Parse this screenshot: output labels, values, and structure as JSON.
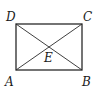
{
  "diagram": {
    "type": "geometry",
    "shape": "rectangle",
    "stroke_color": "#2a2a2a",
    "points": {
      "A": {
        "label": "A",
        "x": 16,
        "y": 70
      },
      "B": {
        "label": "B",
        "x": 82,
        "y": 70
      },
      "C": {
        "label": "C",
        "x": 82,
        "y": 24
      },
      "D": {
        "label": "D",
        "x": 16,
        "y": 24
      },
      "E": {
        "label": "E",
        "x": 49,
        "y": 47
      }
    },
    "segments": [
      "AB",
      "BC",
      "CD",
      "DA",
      "AC",
      "BD"
    ]
  }
}
